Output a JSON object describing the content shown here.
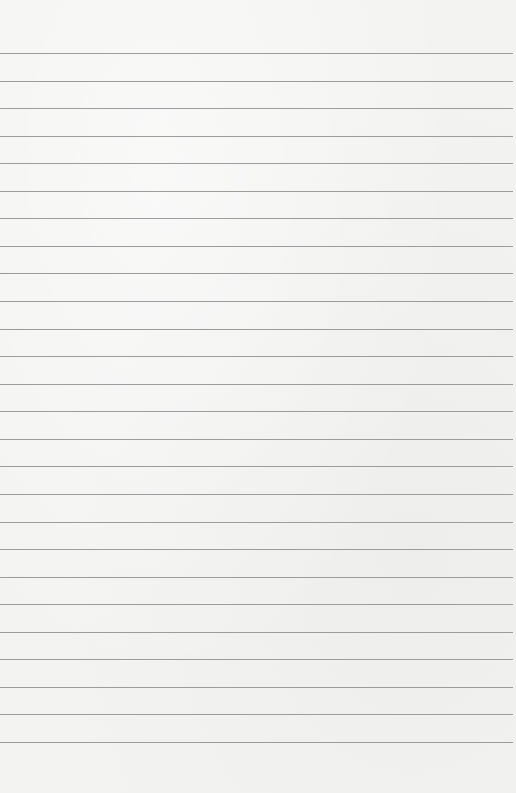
{
  "page": {
    "type": "lined-paper",
    "background_color": "#f3f3f2",
    "line_color": "#9c9c9c",
    "line_count": 26,
    "first_line_y": 53,
    "line_spacing": 27.56
  }
}
